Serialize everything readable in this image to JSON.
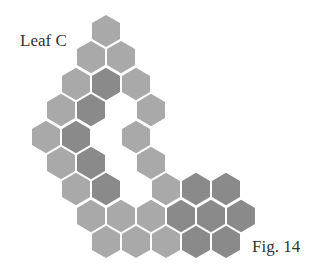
{
  "labels": {
    "title": "Leaf C",
    "figure": "Fig. 14"
  },
  "colors": {
    "light": "#a9a9a9",
    "dark": "#8a8a8a",
    "background": "#ffffff"
  },
  "hex": {
    "width": 28,
    "height": 32.3
  },
  "cells": [
    {
      "x": 106,
      "y": 31,
      "shade": "light"
    },
    {
      "x": 91,
      "y": 57,
      "shade": "light"
    },
    {
      "x": 121,
      "y": 57,
      "shade": "light"
    },
    {
      "x": 76,
      "y": 84,
      "shade": "light"
    },
    {
      "x": 106,
      "y": 84,
      "shade": "dark"
    },
    {
      "x": 136,
      "y": 84,
      "shade": "light"
    },
    {
      "x": 61,
      "y": 110,
      "shade": "light"
    },
    {
      "x": 91,
      "y": 110,
      "shade": "dark"
    },
    {
      "x": 151,
      "y": 110,
      "shade": "light"
    },
    {
      "x": 46,
      "y": 137,
      "shade": "light"
    },
    {
      "x": 76,
      "y": 137,
      "shade": "dark"
    },
    {
      "x": 136,
      "y": 137,
      "shade": "light"
    },
    {
      "x": 61,
      "y": 163,
      "shade": "light"
    },
    {
      "x": 91,
      "y": 163,
      "shade": "dark"
    },
    {
      "x": 151,
      "y": 163,
      "shade": "light"
    },
    {
      "x": 76,
      "y": 189,
      "shade": "light"
    },
    {
      "x": 106,
      "y": 189,
      "shade": "dark"
    },
    {
      "x": 166,
      "y": 189,
      "shade": "light"
    },
    {
      "x": 196,
      "y": 189,
      "shade": "dark"
    },
    {
      "x": 226,
      "y": 189,
      "shade": "dark"
    },
    {
      "x": 91,
      "y": 216,
      "shade": "light"
    },
    {
      "x": 121,
      "y": 216,
      "shade": "light"
    },
    {
      "x": 151,
      "y": 216,
      "shade": "light"
    },
    {
      "x": 181,
      "y": 216,
      "shade": "dark"
    },
    {
      "x": 211,
      "y": 216,
      "shade": "dark"
    },
    {
      "x": 241,
      "y": 216,
      "shade": "dark"
    },
    {
      "x": 106,
      "y": 242,
      "shade": "light"
    },
    {
      "x": 136,
      "y": 242,
      "shade": "light"
    },
    {
      "x": 166,
      "y": 242,
      "shade": "light"
    },
    {
      "x": 196,
      "y": 242,
      "shade": "dark"
    },
    {
      "x": 226,
      "y": 242,
      "shade": "dark"
    }
  ]
}
